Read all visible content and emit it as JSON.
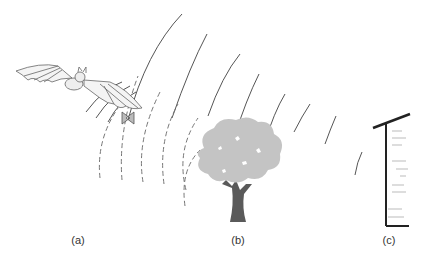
{
  "figure": {
    "panels": [
      {
        "id": "a",
        "label": "(a)",
        "subject": "bat and insect",
        "x": 78
      },
      {
        "id": "b",
        "label": "(b)",
        "subject": "tree",
        "x": 238
      },
      {
        "id": "c",
        "label": "(c)",
        "subject": "wall",
        "x": 389
      }
    ],
    "colors": {
      "line": "#444444",
      "dashed_wave": "#777777",
      "tree_canopy": "#c4c4c4",
      "tree_trunk": "#5a5a5a",
      "wall": "#222222",
      "label": "#333333"
    },
    "labels_y": 240
  }
}
